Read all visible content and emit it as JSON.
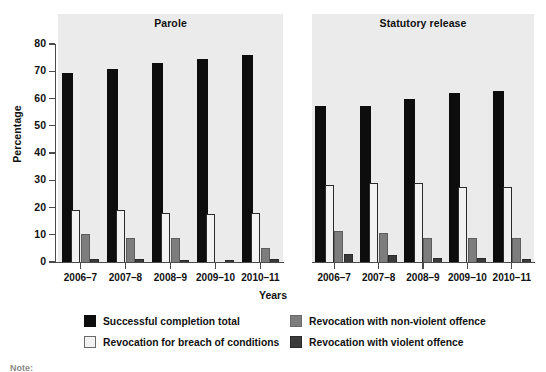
{
  "chart_data": {
    "type": "bar",
    "title": "",
    "xlabel": "Years",
    "ylabel": "Percentage",
    "ylim": [
      0,
      80
    ],
    "yticks": [
      0,
      10,
      20,
      30,
      40,
      50,
      60,
      70,
      80
    ],
    "grid": false,
    "legend_position": "bottom",
    "categories": [
      "2006–7",
      "2007–8",
      "2008–9",
      "2009–10",
      "2010–11"
    ],
    "panels": [
      {
        "name": "Parole",
        "series": [
          {
            "name": "Successful completion total",
            "color": "#0d0d0d",
            "values": [
              69.0,
              70.5,
              72.5,
              74.0,
              75.5
            ]
          },
          {
            "name": "Revocation for breach of conditions",
            "color": "#f2f2f2",
            "values": [
              19.5,
              19.5,
              18.5,
              18.0,
              18.5
            ]
          },
          {
            "name": "Revocation with non-violent offence",
            "color": "#7d7d7d",
            "values": [
              10.8,
              9.0,
              9.0,
              0.0,
              5.5
            ]
          },
          {
            "name": "Revocation with violent offence",
            "color": "#3a3a3a",
            "values": [
              1.4,
              1.5,
              1.2,
              1.0,
              1.3
            ]
          }
        ]
      },
      {
        "name": "Statutory release",
        "series": [
          {
            "name": "Successful completion total",
            "color": "#0d0d0d",
            "values": [
              57.0,
              57.0,
              59.5,
              61.5,
              62.5
            ]
          },
          {
            "name": "Revocation for breach of conditions",
            "color": "#f2f2f2",
            "values": [
              28.8,
              29.5,
              29.5,
              28.0,
              27.8
            ]
          },
          {
            "name": "Revocation with non-violent offence",
            "color": "#7d7d7d",
            "values": [
              11.8,
              11.0,
              9.3,
              9.3,
              9.0
            ]
          },
          {
            "name": "Revocation with violent offence",
            "color": "#3a3a3a",
            "values": [
              3.3,
              3.0,
              2.0,
              1.8,
              1.3
            ]
          }
        ]
      }
    ],
    "legend": [
      "Successful completion total",
      "Revocation for breach of conditions",
      "Revocation with non-violent offence",
      "Revocation with violent offence"
    ]
  },
  "footnote": "Note:"
}
